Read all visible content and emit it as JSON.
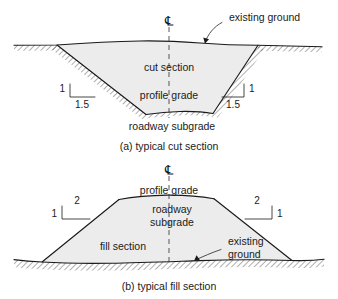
{
  "figure": {
    "colors": {
      "line": "#1a1a1a",
      "section_fill": "#ececec",
      "centerline": "#3a3a3a",
      "background": "#ffffff"
    }
  },
  "panel_a": {
    "caption": "(a) typical cut section",
    "centerline_symbol": "℄",
    "centerline_name": "centerline",
    "labels": {
      "existing_ground": "existing ground",
      "cut_section": "cut section",
      "profile_grade": "profile grade",
      "roadway_subgrade": "roadway subgrade"
    },
    "slopes": {
      "left": {
        "vertical": "1",
        "horizontal": "1.5"
      },
      "right": {
        "vertical": "1",
        "horizontal": "1.5"
      }
    }
  },
  "panel_b": {
    "caption": "(b) typical fill section",
    "centerline_symbol": "℄",
    "centerline_name": "centerline",
    "labels": {
      "profile_grade": "profile grade",
      "roadway_subgrade_line1": "roadway",
      "roadway_subgrade_line2": "subgrade",
      "fill_section": "fill section",
      "existing_ground_line1": "existing",
      "existing_ground_line2": "ground"
    },
    "slopes": {
      "left": {
        "vertical": "1",
        "horizontal": "2"
      },
      "right": {
        "vertical": "1",
        "horizontal": "2"
      }
    }
  }
}
